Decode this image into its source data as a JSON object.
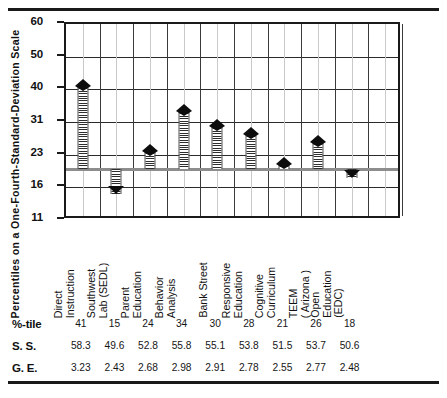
{
  "chart_data": {
    "type": "bar",
    "title": "",
    "xlabel": "",
    "ylabel": "Percentiles on a One-Fourth-Standard-Deviation Scale",
    "ylim": [
      11,
      60
    ],
    "yticks": [
      60,
      50,
      40,
      31,
      23,
      16,
      11
    ],
    "baseline": 20,
    "grid": true,
    "legend": "none",
    "categories": [
      "Direct Instruction",
      "Southwest Lab (SEDL)",
      "Parent Education",
      "Behavior Analysis",
      "Bank Street",
      "Responsive Education",
      "Cognitive Curriculum",
      "TEEM ( Arizona )",
      "Open Education (EDC)"
    ],
    "category_lines": [
      [
        "Direct",
        "Instruction"
      ],
      [
        "Southwest",
        "Lab (SEDL)"
      ],
      [
        "Parent",
        "Education"
      ],
      [
        "Behavior",
        "Analysis"
      ],
      [
        "Bank  Street"
      ],
      [
        "Responsive",
        "Education"
      ],
      [
        "Cognitive",
        "Curriculum"
      ],
      [
        "TEEM",
        "( Arizona )"
      ],
      [
        "Open",
        "Education",
        "(EDC)"
      ]
    ],
    "values": [
      41,
      15,
      24,
      34,
      30,
      28,
      21,
      26,
      18
    ],
    "series": [
      {
        "name": "%-tile",
        "values": [
          41,
          15,
          24,
          34,
          30,
          28,
          21,
          26,
          18
        ]
      },
      {
        "name": "S. S.",
        "values": [
          58.3,
          49.6,
          52.8,
          55.8,
          55.1,
          53.8,
          51.5,
          53.7,
          50.6
        ]
      },
      {
        "name": "G. E.",
        "values": [
          3.23,
          2.43,
          2.68,
          2.98,
          2.91,
          2.78,
          2.55,
          2.77,
          2.48
        ]
      }
    ]
  },
  "axis": {
    "ticks": [
      "60",
      "50",
      "40",
      "31",
      "23",
      "16",
      "11"
    ],
    "title": "Percentiles on  a  One-Fourth-Standard-Deviation  Scale"
  },
  "table": {
    "rows": [
      {
        "label": "%-tile",
        "values": [
          "41",
          "15",
          "24",
          "34",
          "30",
          "28",
          "21",
          "26",
          "18"
        ]
      },
      {
        "label": "S. S.",
        "values": [
          "58.3",
          "49.6",
          "52.8",
          "55.8",
          "55.1",
          "53.8",
          "51.5",
          "53.7",
          "50.6"
        ]
      },
      {
        "label": "G. E.",
        "values": [
          "3.23",
          "2.43",
          "2.68",
          "2.98",
          "2.91",
          "2.78",
          "2.55",
          "2.77",
          "2.48"
        ]
      }
    ]
  },
  "colors": {
    "ink": "#111111",
    "grid": "#2a2a2a",
    "minor_grid": "#c9c9c9",
    "baseline": "#8d8d8d",
    "marker": "#0d0d0d"
  }
}
